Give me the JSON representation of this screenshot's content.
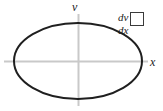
{
  "figure": {
    "background_color": "#ffffff",
    "axis_color": "#c9c9c9",
    "curve_color": "#1f1f1f",
    "text_color": "#1c1c1c",
    "width": 163,
    "height": 111
  },
  "axes": {
    "vertical_label": "v",
    "horizontal_label": "x",
    "origin": {
      "x": 78,
      "y": 61
    },
    "horizontal_extent": {
      "from_x": 4,
      "to_x": 148
    },
    "vertical_extent": {
      "from_y": 14,
      "to_y": 106
    }
  },
  "curve": {
    "type": "ellipse",
    "center_x": 78,
    "center_y": 61,
    "radius_x": 64,
    "radius_y": 38,
    "stroke_width": 2
  },
  "annotation": {
    "numerator": "dv",
    "denominator": "dx",
    "answer_value": ""
  }
}
